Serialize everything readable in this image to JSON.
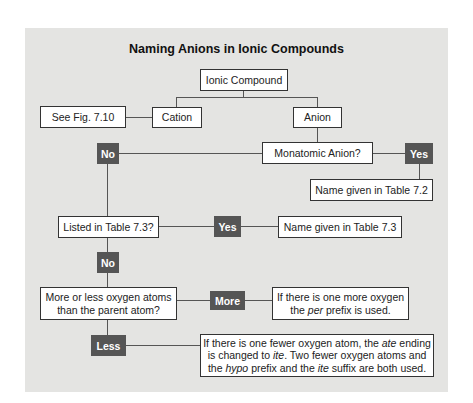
{
  "diagram": {
    "title": "Naming Anions in Ionic Compounds",
    "nodes": {
      "ionic_compound": "Ionic Compound",
      "cation": "Cation",
      "anion": "Anion",
      "see_fig": "See Fig. 7.10",
      "monatomic": "Monatomic Anion?",
      "no_1": "No",
      "yes_1": "Yes",
      "name_72": "Name given in Table 7.2",
      "listed_73": "Listed in Table 7.3?",
      "yes_2": "Yes",
      "name_73": "Name given in Table 7.3",
      "no_2": "No",
      "more_less": "More or less oxygen atoms than the parent atom?",
      "more_less_l1": "More or less oxygen atoms",
      "more_less_l2": "than the parent atom?",
      "more": "More",
      "more_result_l1": "If there is one more oxygen",
      "more_result_l2_pre": "the ",
      "more_result_l2_em": "per",
      "more_result_l2_post": " prefix is used.",
      "less": "Less",
      "less_result_l1_pre": "If there is one fewer oxygen atom, the ",
      "less_result_l1_em": "ate",
      "less_result_l1_post": " ending",
      "less_result_l2_pre": "is changed to ",
      "less_result_l2_em": "ite",
      "less_result_l2_post": ". Two fewer oxygen atoms and",
      "less_result_l3_pre": "the ",
      "less_result_l3_em1": "hypo",
      "less_result_l3_mid": " prefix and the ",
      "less_result_l3_em2": "ite",
      "less_result_l3_post": " suffix are both used."
    },
    "colors": {
      "panel_bg": "#e4e4e2",
      "decision_bg": "#555555",
      "box_bg": "#ffffff",
      "line": "#555555"
    }
  }
}
